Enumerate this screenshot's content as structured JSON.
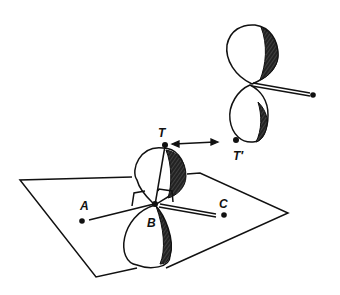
{
  "diagram": {
    "type": "orbital-geometry",
    "labels": {
      "T": "T",
      "T_prime": "T′",
      "A": "A",
      "B": "B",
      "C": "C"
    },
    "colors": {
      "ink": "#111111",
      "background": "#ffffff",
      "shade": "#222222"
    },
    "elements": [
      {
        "id": "plane",
        "kind": "parallelogram"
      },
      {
        "id": "lower-orbital",
        "kind": "p-orbital",
        "center_atom": "B",
        "top_point": "T"
      },
      {
        "id": "upper-orbital",
        "kind": "p-orbital",
        "bottom_point": "T'"
      },
      {
        "id": "bond-BA",
        "kind": "single-bond",
        "from": "B",
        "to": "A"
      },
      {
        "id": "bond-BC",
        "kind": "double-line-bond",
        "from": "B",
        "to": "C"
      },
      {
        "id": "bond-BT",
        "kind": "single-bond",
        "from": "B",
        "to": "T"
      },
      {
        "id": "upper-bond",
        "kind": "double-line-bond"
      },
      {
        "id": "arrow-T-Tprime",
        "kind": "double-headed-arrow",
        "from": "T",
        "to": "T'"
      },
      {
        "id": "angle-brackets",
        "kind": "bracket-pair",
        "at": "B"
      }
    ]
  }
}
